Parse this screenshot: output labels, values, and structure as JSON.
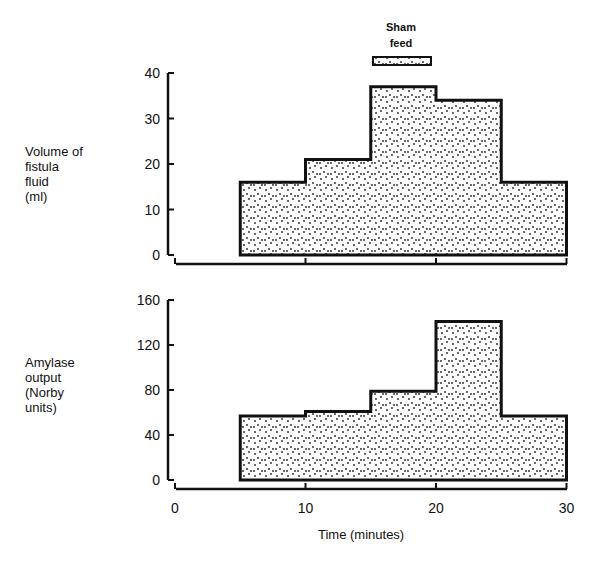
{
  "chart_data": [
    {
      "type": "area",
      "title": "",
      "ylabel": "Volume of fistula fluid (ml)",
      "xlabel": "",
      "ylim": [
        0,
        40
      ],
      "yticks": [
        0,
        10,
        20,
        30,
        40
      ],
      "x_bins": [
        [
          5,
          10
        ],
        [
          10,
          15
        ],
        [
          15,
          20
        ],
        [
          20,
          25
        ],
        [
          25,
          30
        ]
      ],
      "values": [
        16,
        21,
        37,
        34,
        16
      ],
      "annotation": {
        "text": "Sham feed",
        "x_range": [
          15,
          20
        ]
      }
    },
    {
      "type": "area",
      "title": "",
      "ylabel": "Amylase output (Norby units)",
      "xlabel": "Time (minutes)",
      "ylim": [
        0,
        160
      ],
      "yticks": [
        0,
        40,
        80,
        120,
        160
      ],
      "xticks": [
        0,
        10,
        20,
        30
      ],
      "x_bins": [
        [
          5,
          10
        ],
        [
          10,
          15
        ],
        [
          15,
          20
        ],
        [
          20,
          25
        ],
        [
          25,
          30
        ]
      ],
      "values": [
        57,
        61,
        79,
        141,
        57
      ]
    }
  ],
  "labels": {
    "top_ylabel": [
      "Volume of",
      "fistula",
      "fluid",
      "(ml)"
    ],
    "bottom_ylabel": [
      "Amylase",
      "output",
      "(Norby",
      "units)"
    ],
    "annotation": [
      "Sham",
      "feed"
    ],
    "xlabel": "Time (minutes)",
    "top_yticks": [
      "40",
      "30",
      "20",
      "10",
      "0"
    ],
    "bottom_yticks": [
      "160",
      "120",
      "80",
      "40",
      "0"
    ],
    "xticks": [
      "0",
      "10",
      "20",
      "30"
    ]
  }
}
